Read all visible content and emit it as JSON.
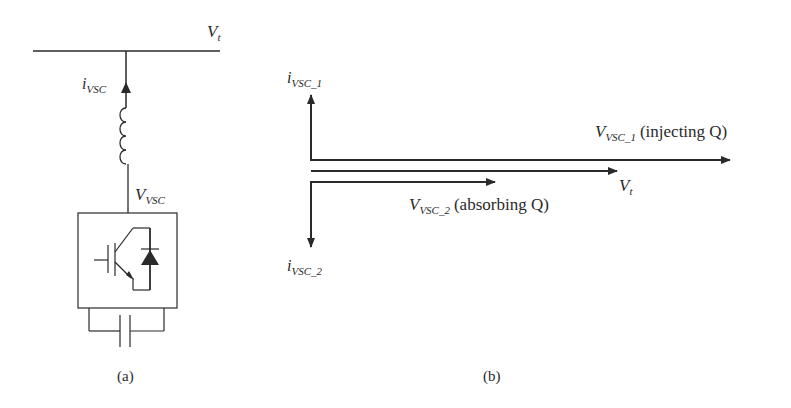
{
  "figure": {
    "panel_a": {
      "caption": "(a)",
      "bus_voltage_label": {
        "main": "V",
        "sub": "t"
      },
      "current_label": {
        "main": "i",
        "sub": "VSC"
      },
      "converter_voltage_label": {
        "main": "V",
        "sub": "VSC"
      },
      "components": [
        "bus-line",
        "inductor",
        "igbt-with-antiparallel-diode",
        "dc-capacitor"
      ]
    },
    "panel_b": {
      "caption": "(b)",
      "phasors": [
        {
          "name": "V_VSC_1",
          "main": "V",
          "sub": "VSC_1",
          "note": "(injecting Q)"
        },
        {
          "name": "V_t",
          "main": "V",
          "sub": "t",
          "note": ""
        },
        {
          "name": "V_VSC_2",
          "main": "V",
          "sub": "VSC_2",
          "note": "(absorbing Q)"
        }
      ],
      "currents": [
        {
          "name": "i_VSC_1",
          "main": "i",
          "sub": "VSC_1",
          "direction": "up"
        },
        {
          "name": "i_VSC_2",
          "main": "i",
          "sub": "VSC_2",
          "direction": "down"
        }
      ]
    },
    "colors": {
      "stroke": "#2a2a2a",
      "background": "#ffffff"
    }
  }
}
